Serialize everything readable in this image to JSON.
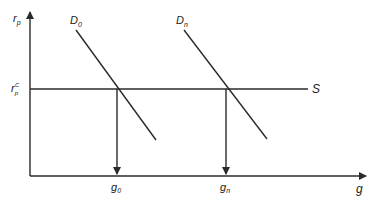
{
  "diagram": {
    "type": "supply-demand",
    "axes": {
      "y_label": "r",
      "y_label_sub": "p",
      "x_label": "g"
    },
    "supply": {
      "label": "S",
      "level_label": "r",
      "level_label_sub": "p",
      "level_label_sup": "C"
    },
    "demand_curves": [
      {
        "label": "D",
        "sub": "0"
      },
      {
        "label": "D",
        "sub": "n"
      }
    ],
    "equilibria": [
      {
        "label": "g",
        "sub": "0"
      },
      {
        "label": "g",
        "sub": "n"
      }
    ],
    "colors": {
      "line": "#2a2a2a",
      "background": "#ffffff"
    }
  }
}
